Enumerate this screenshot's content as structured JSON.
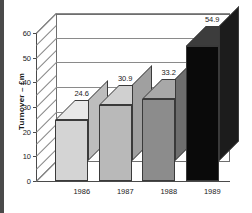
{
  "chart_data": {
    "type": "bar",
    "title": "",
    "subtitle": "",
    "xlabel": "",
    "ylabel": "Turnover – £m",
    "categories": [
      "1986",
      "1987",
      "1988",
      "1989"
    ],
    "values": [
      24.6,
      30.9,
      33.2,
      54.9
    ],
    "data_labels": [
      "24.6",
      "30.9",
      "33.2",
      "54.9"
    ],
    "ylim": [
      0,
      60
    ],
    "y_ticks": [
      0,
      10,
      20,
      30,
      40,
      50,
      60
    ],
    "y_tick_labels": [
      "0",
      "10",
      "20",
      "30",
      "40",
      "50",
      "60"
    ],
    "y_minor_tick_interval": 5,
    "grid": true,
    "grid_orientation": "horizontal",
    "legend": false,
    "legend_position": "none",
    "style": "3d",
    "series": [
      {
        "name": "Turnover",
        "values": [
          24.6,
          30.9,
          33.2,
          54.9
        ]
      }
    ],
    "bar_colors": [
      "#d4d4d4",
      "#b9b9b9",
      "#8c8c8c",
      "#0a0a0a"
    ],
    "bar_top_colors": [
      "#e8e8e8",
      "#d0d0d0",
      "#a8a8a8",
      "#3c3c3c"
    ],
    "bar_side_colors": [
      "#bdbdbd",
      "#a0a0a0",
      "#6e6e6e",
      "#1c1c1c"
    ],
    "axis_color": "#4a4a4a",
    "gridline_color": "#8a8a8a",
    "text_color": "#1a1a1a",
    "background_color": "#ffffff"
  }
}
